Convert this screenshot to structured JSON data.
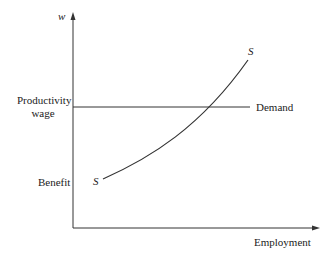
{
  "diagram": {
    "y_axis_label": "w",
    "x_axis_label": "Employment",
    "y_ticks": [
      {
        "label_line1": "Productivity",
        "label_line2": "wage"
      },
      {
        "label_line1": "Benefit"
      }
    ],
    "curves": [
      {
        "name": "S",
        "type": "supply",
        "start_label": "S",
        "end_label": "S"
      },
      {
        "name": "Demand",
        "type": "horizontal",
        "label": "Demand"
      }
    ],
    "colors": {
      "line": "#333333",
      "text": "#222222",
      "background": "#ffffff"
    }
  }
}
